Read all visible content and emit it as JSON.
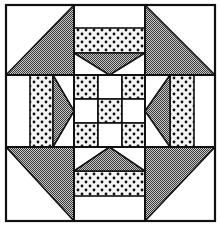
{
  "figure": {
    "kind": "quilt-block-illustration",
    "colors": {
      "background": "#ffffff",
      "line": "#111111",
      "gray_fill": "#8c8c8c",
      "dot": "#111111"
    },
    "grid": {
      "outer": {
        "x0": 6,
        "y0": 5,
        "x1": 215,
        "y1": 221
      },
      "verticals": [
        74,
        145
      ],
      "horizontals": [
        75,
        147
      ],
      "center_ninepatch": {
        "xs": [
          74,
          98,
          122,
          145
        ],
        "ys": [
          75,
          99,
          123,
          147
        ],
        "cells": [
          [
            "dotted",
            "white",
            "dotted"
          ],
          [
            "white",
            "dotted",
            "white"
          ],
          [
            "dotted",
            "white",
            "dotted"
          ]
        ]
      }
    },
    "corners": [
      {
        "name": "top-left",
        "gray_triangle": [
          [
            74,
            5
          ],
          [
            6,
            75
          ],
          [
            74,
            75
          ]
        ]
      },
      {
        "name": "top-right",
        "gray_triangle": [
          [
            145,
            5
          ],
          [
            145,
            75
          ],
          [
            215,
            75
          ]
        ]
      },
      {
        "name": "bottom-left",
        "gray_triangle": [
          [
            6,
            147
          ],
          [
            74,
            147
          ],
          [
            74,
            221
          ]
        ]
      },
      {
        "name": "bottom-right",
        "gray_triangle": [
          [
            145,
            147
          ],
          [
            215,
            147
          ],
          [
            145,
            221
          ]
        ]
      }
    ],
    "sides": [
      {
        "name": "top",
        "dotted_rect": [
          74,
          28,
          145,
          53
        ],
        "gray_triangle": [
          [
            74,
            53
          ],
          [
            145,
            53
          ],
          [
            109.5,
            75
          ]
        ]
      },
      {
        "name": "bottom",
        "dotted_rect": [
          74,
          171,
          145,
          196
        ],
        "gray_triangle": [
          [
            74,
            171
          ],
          [
            145,
            171
          ],
          [
            109.5,
            147
          ]
        ]
      },
      {
        "name": "left",
        "dotted_rect": [
          30,
          75,
          53,
          147
        ],
        "gray_triangle": [
          [
            53,
            75
          ],
          [
            53,
            147
          ],
          [
            74,
            111
          ]
        ]
      },
      {
        "name": "right",
        "dotted_rect": [
          170,
          75,
          194,
          147
        ],
        "gray_triangle": [
          [
            170,
            75
          ],
          [
            170,
            147
          ],
          [
            145,
            111
          ]
        ]
      }
    ]
  }
}
